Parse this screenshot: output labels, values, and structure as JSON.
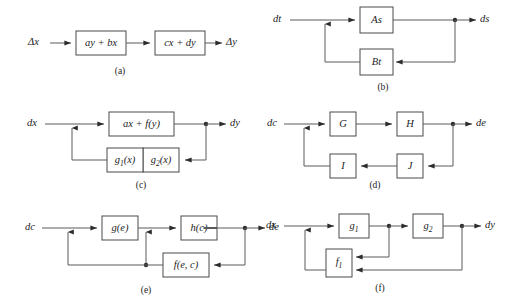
{
  "figure": {
    "background_color": "#ffffff",
    "line_color": "#5a5a5a",
    "box_stroke_color": "#4a4a4a",
    "text_color": "#1c1c1c"
  },
  "panels": {
    "a": {
      "caption": "(a)",
      "input_label": "Δx",
      "output_label": "Δy",
      "blocks": [
        {
          "label": "ay + bx"
        },
        {
          "label": "cx + dy"
        }
      ]
    },
    "b": {
      "caption": "(b)",
      "input_label": "dt",
      "output_label": "ds",
      "blocks": [
        {
          "label": "As"
        },
        {
          "label": "Bt"
        }
      ]
    },
    "c": {
      "caption": "(c)",
      "input_label": "dx",
      "output_label": "dy",
      "blocks": [
        {
          "label": "ax + f(y)"
        },
        {
          "label": "g",
          "sub": "1",
          "tail": "(x)"
        },
        {
          "label": "g",
          "sub": "2",
          "tail": "(x)"
        }
      ]
    },
    "d": {
      "caption": "(d)",
      "input_label": "dc",
      "output_label": "de",
      "blocks": [
        {
          "label": "G"
        },
        {
          "label": "H"
        },
        {
          "label": "I"
        },
        {
          "label": "J"
        }
      ]
    },
    "e": {
      "caption": "(e)",
      "input_label": "dc",
      "output_label": "de",
      "blocks": [
        {
          "label": "g(e)"
        },
        {
          "label": "h(c)"
        },
        {
          "label": "f(e, c)"
        }
      ]
    },
    "f": {
      "caption": "(f)",
      "input_label": "dx",
      "output_label": "dy",
      "blocks": [
        {
          "label": "g",
          "sub": "1"
        },
        {
          "label": "g",
          "sub": "2"
        },
        {
          "label": "f",
          "sub": "1"
        }
      ]
    }
  }
}
